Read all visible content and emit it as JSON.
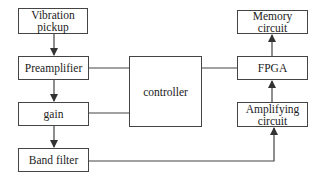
{
  "diagram": {
    "nodes": {
      "vibration_pickup": {
        "label": "Vibration pickup"
      },
      "preamplifier": {
        "label": "Preamplifier"
      },
      "gain": {
        "label": "gain"
      },
      "band_filter": {
        "label": "Band filter"
      },
      "controller": {
        "label": "controller"
      },
      "memory_circuit": {
        "label": "Memory circuit"
      },
      "fpga": {
        "label": "FPGA"
      },
      "amplifying_circuit": {
        "label": "Amplifying circuit"
      }
    },
    "edges": [
      {
        "from": "vibration_pickup",
        "to": "preamplifier",
        "arrow": true
      },
      {
        "from": "preamplifier",
        "to": "gain",
        "arrow": true
      },
      {
        "from": "gain",
        "to": "band_filter",
        "arrow": true
      },
      {
        "from": "preamplifier",
        "to": "controller",
        "arrow": false
      },
      {
        "from": "gain",
        "to": "controller",
        "arrow": false
      },
      {
        "from": "controller",
        "to": "fpga",
        "arrow": false
      },
      {
        "from": "fpga",
        "to": "memory_circuit",
        "arrow": true
      },
      {
        "from": "amplifying_circuit",
        "to": "fpga",
        "arrow": true
      },
      {
        "from": "band_filter",
        "to": "amplifying_circuit",
        "arrow": true
      }
    ],
    "colors": {
      "stroke": "#444444",
      "background": "#ffffff",
      "text": "#222222"
    }
  }
}
